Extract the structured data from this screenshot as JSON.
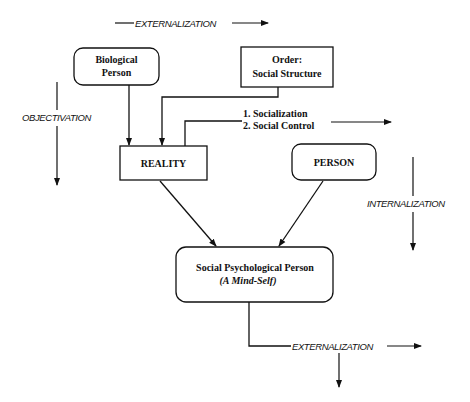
{
  "diagram": {
    "nodes": {
      "biological_person": {
        "line1": "Biological",
        "line2": "Person",
        "shape": "rounded"
      },
      "order": {
        "line1": "Order:",
        "line2": "Social Structure",
        "shape": "rectangle"
      },
      "reality": {
        "label": "REALITY",
        "shape": "rectangle"
      },
      "person": {
        "label": "PERSON",
        "shape": "rounded"
      },
      "social_psych_person": {
        "line1": "Social Psychological Person",
        "line2": "(A Mind-Self)",
        "shape": "rounded"
      }
    },
    "labels": {
      "externalization_top": "EXTERNALIZATION",
      "objectivation": "OBJECTIVATION",
      "internalization": "INTERNALIZATION",
      "externalization_bottom": "EXTERNALIZATION"
    },
    "process_list": {
      "item1": "1.  Socialization",
      "item2": "2.  Social Control"
    },
    "colors": {
      "stroke": "#111111",
      "background": "#ffffff"
    }
  }
}
